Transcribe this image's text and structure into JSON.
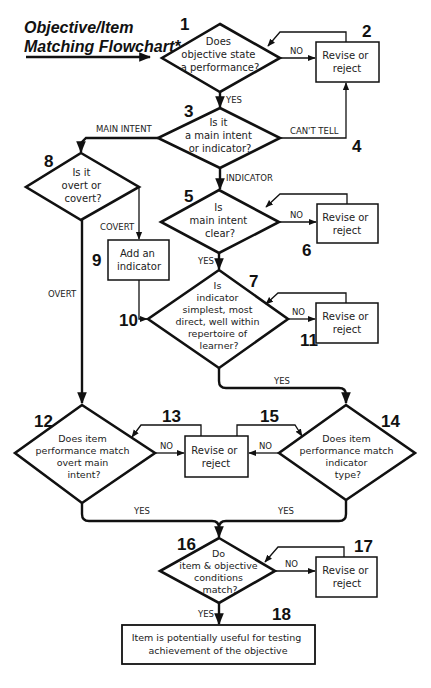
{
  "title": {
    "line1": "Objective/Item",
    "line2": "Matching Flowchart*"
  },
  "nodes": {
    "n1": {
      "number": "1",
      "type": "decision",
      "lines": [
        "Does",
        "objective state",
        "a performance?"
      ]
    },
    "n2": {
      "number": "2",
      "type": "process",
      "lines": [
        "Revise or",
        "reject"
      ]
    },
    "n3": {
      "number": "3",
      "type": "decision",
      "lines": [
        "Is it",
        "a main intent",
        "or indicator?"
      ]
    },
    "n4": {
      "number": "4"
    },
    "n5": {
      "number": "5",
      "type": "decision",
      "lines": [
        "Is",
        "main intent",
        "clear?"
      ]
    },
    "n6": {
      "number": "6",
      "type": "process",
      "lines": [
        "Revise or",
        "reject"
      ]
    },
    "n7": {
      "number": "7",
      "type": "decision",
      "lines": [
        "Is",
        "indicator",
        "simplest, most",
        "direct, well within",
        "repertoire of",
        "learner?"
      ]
    },
    "n8": {
      "number": "8",
      "type": "decision",
      "lines": [
        "Is it",
        "overt or",
        "covert?"
      ]
    },
    "n9": {
      "number": "9",
      "type": "process",
      "lines": [
        "Add an",
        "indicator"
      ]
    },
    "n10": {
      "number": "10"
    },
    "n11": {
      "number": "11",
      "type": "process",
      "lines": [
        "Revise or",
        "reject"
      ]
    },
    "n12": {
      "number": "12",
      "type": "decision",
      "lines": [
        "Does item",
        "performance match",
        "overt main",
        "intent?"
      ]
    },
    "n13": {
      "number": "13",
      "type": "process",
      "lines": [
        "Revise or",
        "reject"
      ]
    },
    "n14": {
      "number": "14",
      "type": "decision",
      "lines": [
        "Does item",
        "performance match",
        "indicator",
        "type?"
      ]
    },
    "n15": {
      "number": "15"
    },
    "n16": {
      "number": "16",
      "type": "decision",
      "lines": [
        "Do",
        "item & objective",
        "conditions",
        "match?"
      ]
    },
    "n17": {
      "number": "17",
      "type": "process",
      "lines": [
        "Revise or",
        "reject"
      ]
    },
    "n18": {
      "number": "18",
      "type": "terminal",
      "lines": [
        "Item is potentially useful for testing",
        "achievement of the objective"
      ]
    }
  },
  "edge_labels": {
    "n1_no": "NO",
    "n1_yes": "YES",
    "n3_main_intent": "MAIN INTENT",
    "n3_cant_tell": "CAN'T TELL",
    "n3_indicator": "INDICATOR",
    "n5_no": "NO",
    "n5_yes": "YES",
    "n8_covert": "COVERT",
    "n8_overt": "OVERT",
    "n7_no": "NO",
    "n7_yes": "YES",
    "n12_no": "NO",
    "n14_no": "NO",
    "n12_yes": "YES",
    "n14_yes": "YES",
    "n16_no": "NO",
    "n16_yes": "YES"
  }
}
